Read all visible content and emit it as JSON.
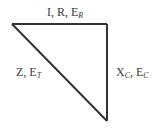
{
  "diagram": {
    "type": "impedance-triangle",
    "colors": {
      "line": "#333333",
      "text": "#3a3a3a",
      "background": "#ffffff"
    },
    "vertices": {
      "top_left": [
        12,
        24
      ],
      "top_right": [
        107,
        24
      ],
      "bottom": [
        107,
        121
      ]
    },
    "labels": {
      "top": {
        "main": "I, R, E",
        "sub": "R"
      },
      "hypotenuse": {
        "main": "Z, E",
        "sub": "T"
      },
      "vertical": {
        "part1": "X",
        "sub1": "C",
        "part2": ", E",
        "sub2": "C"
      }
    }
  }
}
